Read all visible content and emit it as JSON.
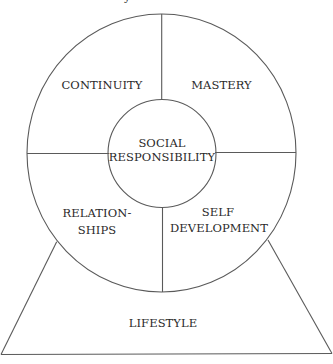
{
  "diagram": {
    "type": "wheel-on-base",
    "colors": {
      "line": "#5a5a5a",
      "text": "#2a2a2a",
      "background": "#ffffff"
    },
    "top_cropped_glyph": "y",
    "center": {
      "line1": "SOCIAL",
      "line2": "RESPONSIBILITY"
    },
    "quadrants": {
      "top_left": {
        "line1": "CONTINUITY"
      },
      "top_right": {
        "line1": "MASTERY"
      },
      "bottom_left": {
        "line1": "RELATION-",
        "line2": "SHIPS"
      },
      "bottom_right": {
        "line1": "SELF",
        "line2": "DEVELOPMENT"
      }
    },
    "base": {
      "label": "LIFESTYLE"
    }
  }
}
